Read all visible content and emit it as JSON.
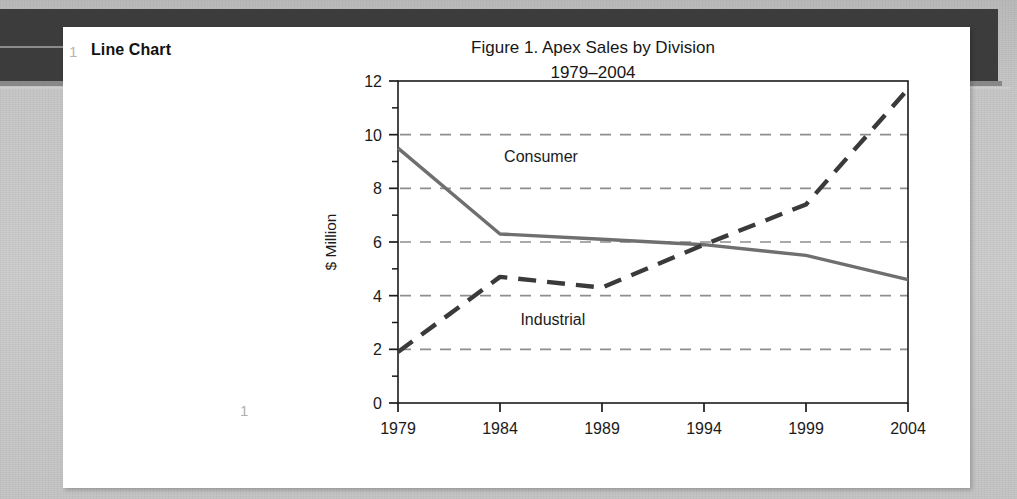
{
  "slide": {
    "number": "1",
    "title": "Line Chart",
    "page_number": "1"
  },
  "figure": {
    "title_line1": "Figure 1.  Apex Sales by Division",
    "title_line2": "1979–2004"
  },
  "colors": {
    "page_background": "#ffffff",
    "backdrop": "#c9c9c9",
    "dark_band": "#3c3c3c",
    "axis": "#1b1b1b",
    "gridline": "#8e8e8e",
    "consumer_line": "#6f6f6f",
    "industrial_line": "#3a3a3a",
    "muted_number": "#b4b4b4"
  },
  "chart_data": {
    "type": "line",
    "title": "Figure 1.  Apex Sales by Division 1979–2004",
    "xlabel": "",
    "ylabel": "$ Million",
    "categories": [
      "1979",
      "1984",
      "1989",
      "1994",
      "1999",
      "2004"
    ],
    "x": [
      1979,
      1984,
      1989,
      1994,
      1999,
      2004
    ],
    "xlim": [
      1979,
      2004
    ],
    "ylim": [
      0,
      12
    ],
    "yticks": [
      0,
      2,
      4,
      6,
      8,
      10,
      12
    ],
    "yminorticks": [
      1,
      3,
      5,
      7,
      9,
      11
    ],
    "xticklabels": [
      "1979",
      "1984",
      "1989",
      "1994",
      "1999",
      "2004"
    ],
    "yticklabels": [
      "0",
      "2",
      "4",
      "6",
      "8",
      "10",
      "12"
    ],
    "grid": true,
    "grid_axis": "y",
    "grid_style": "dashed",
    "legend": "inline-labels",
    "series": [
      {
        "name": "Consumer",
        "style": "solid",
        "color": "#6f6f6f",
        "values": [
          9.5,
          6.3,
          6.1,
          5.9,
          5.5,
          4.6
        ],
        "label_x": 1984.2,
        "label_y": 9.0
      },
      {
        "name": "Industrial",
        "style": "dashed",
        "color": "#3a3a3a",
        "values": [
          1.9,
          4.7,
          4.3,
          5.9,
          7.4,
          11.7
        ],
        "label_x": 1985.0,
        "label_y": 2.9
      }
    ]
  }
}
